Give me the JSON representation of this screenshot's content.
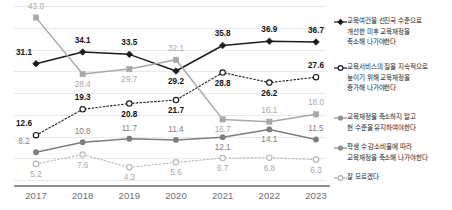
{
  "chart_data": {
    "type": "line",
    "title": "",
    "subtitle": "",
    "xlabel": "",
    "ylabel": "",
    "x": [
      "2017",
      "2018",
      "2019",
      "2020",
      "2021",
      "2022",
      "2023"
    ],
    "categories": [
      "2017",
      "2018",
      "2019",
      "2020",
      "2021",
      "2022",
      "2023"
    ],
    "ylim": [
      0,
      46
    ],
    "grid": true,
    "grid_axis": "y",
    "legend_position": "right",
    "series": [
      {
        "name": "교육여건을 선진국 수준으로 개선한 미후 교육재정을 축소해 나가야한다",
        "values": [
          31.1,
          34.1,
          33.5,
          29.2,
          35.8,
          36.9,
          36.7
        ],
        "color": "#1c1c1c",
        "marker": "filled-diamond",
        "line": "solid",
        "label_style": "bold"
      },
      {
        "name": "교육서비스의 질을 지속적으로 높이기 위해 교육재정을 증가해 나가야한다",
        "values": [
          12.6,
          19.3,
          20.8,
          21.7,
          28.8,
          26.2,
          27.6
        ],
        "color": "#1c1c1c",
        "marker": "open-circle",
        "line": "dotted",
        "label_style": "bold"
      },
      {
        "name": "교육재정을 축소하지 말고 현 수준을 유지하여야한다",
        "values": [
          43.0,
          28.4,
          29.7,
          32.1,
          16.7,
          16.1,
          18.0
        ],
        "color": "#a9a9ac",
        "marker": "filled-square",
        "line": "solid",
        "label_style": "light"
      },
      {
        "name": "학생 수 감소비율에 따라 교육재정을 축소해 나가야한다",
        "values": [
          8.2,
          10.8,
          11.7,
          11.4,
          12.1,
          14.1,
          11.5
        ],
        "color": "#7e7e81",
        "marker": "filled-circle",
        "line": "solid",
        "label_style": "mid"
      },
      {
        "name": "잘 모르겠다",
        "values": [
          5.2,
          7.6,
          4.3,
          5.6,
          6.7,
          6.8,
          6.3
        ],
        "color": "#b8b8bb",
        "marker": "open-circle",
        "line": "dotted",
        "label_style": "light"
      }
    ],
    "data_labels": {
      "series_1": [
        "31.1",
        "34.1",
        "33.5",
        "29.2",
        "35.8",
        "36.9",
        "36.7"
      ],
      "series_2": [
        "12.6",
        "19.3",
        "20.8",
        "21.7",
        "28.8",
        "26.2",
        "27.6"
      ],
      "series_3": [
        "43.0",
        "28.4",
        "29.7",
        "32.1",
        "16.7",
        "16.1",
        "18.0"
      ],
      "series_4": [
        "8.2",
        "10.8",
        "11.7",
        "11.4",
        "12.1",
        "14.1",
        "11.5"
      ],
      "series_5": [
        "5.2",
        "7.6",
        "4.3",
        "5.6",
        "6.7",
        "6.8",
        "6.3"
      ]
    }
  },
  "legend": {
    "items": [
      {
        "label": "교육여건을 선진국 수준으로\n개선한 미후 교육재정을\n축소해 나가야한다",
        "marker": "filled-diamond",
        "line": "solid",
        "color": "#1c1c1c"
      },
      {
        "label": "교육서비스의 질을 지속적으로\n높이기 위해 교육재정을\n증가해 나가야한다",
        "marker": "open-circle",
        "line": "solid",
        "color": "#1c1c1c"
      },
      {
        "label": "교육재정을 축소하지 말고\n현 수준을 유지하여야한다",
        "marker": "filled-circle",
        "line": "solid",
        "color": "#8e8e91"
      },
      {
        "label": "학생 수 감소비율에 따라\n교육재정을 축소해 나가야한다",
        "marker": "filled-circle",
        "line": "solid",
        "color": "#8e8e91"
      },
      {
        "label": "잘 모르겠다",
        "marker": "open-circle",
        "line": "solid",
        "color": "#b0b0b3"
      }
    ]
  },
  "axis": {
    "x_ticks": [
      "2017",
      "2018",
      "2019",
      "2020",
      "2021",
      "2022",
      "2023"
    ]
  },
  "colors": {
    "series_black": "#1c1c1c",
    "series_light_grey": "#a9a9ac",
    "series_mid_grey": "#7e7e81",
    "series_pale_grey": "#b8b8bb",
    "gridline": "#e9e9ea",
    "axis": "#8d8d8f",
    "background": "#ffffff"
  }
}
